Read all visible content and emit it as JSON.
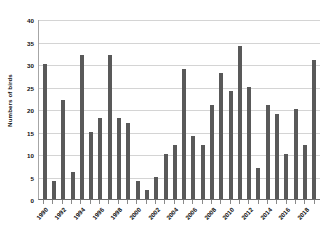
{
  "chart_data": {
    "type": "bar",
    "title": "",
    "xlabel": "",
    "ylabel": "Numbers of birds",
    "ylim": [
      0,
      40
    ],
    "ytick_step": 5,
    "yticks": [
      0,
      5,
      10,
      15,
      20,
      25,
      30,
      35,
      40
    ],
    "grid": true,
    "legend": false,
    "bar_color": "#595959",
    "gridline_color": "#d4d4d4",
    "axis_color": "#6e6e6e",
    "xtick_label_every": 2,
    "xtick_labels": [
      "1990",
      "1992",
      "1994",
      "1996",
      "1998",
      "2000",
      "2002",
      "2004",
      "2006",
      "2008",
      "2010",
      "2012",
      "2014",
      "2016",
      "2018"
    ],
    "categories": [
      "1990",
      "1991",
      "1992",
      "1993",
      "1994",
      "1995",
      "1996",
      "1997",
      "1998",
      "1999",
      "2000",
      "2001",
      "2002",
      "2003",
      "2004",
      "2005",
      "2006",
      "2007",
      "2008",
      "2009",
      "2010",
      "2011",
      "2012",
      "2013",
      "2014",
      "2015",
      "2016",
      "2017",
      "2018",
      "2019"
    ],
    "values": [
      30,
      4,
      22,
      6,
      32,
      15,
      18,
      32,
      18,
      17,
      4,
      2,
      5,
      10,
      12,
      29,
      14,
      12,
      21,
      28,
      24,
      34,
      25,
      7,
      21,
      19,
      10,
      20,
      12,
      31
    ]
  }
}
